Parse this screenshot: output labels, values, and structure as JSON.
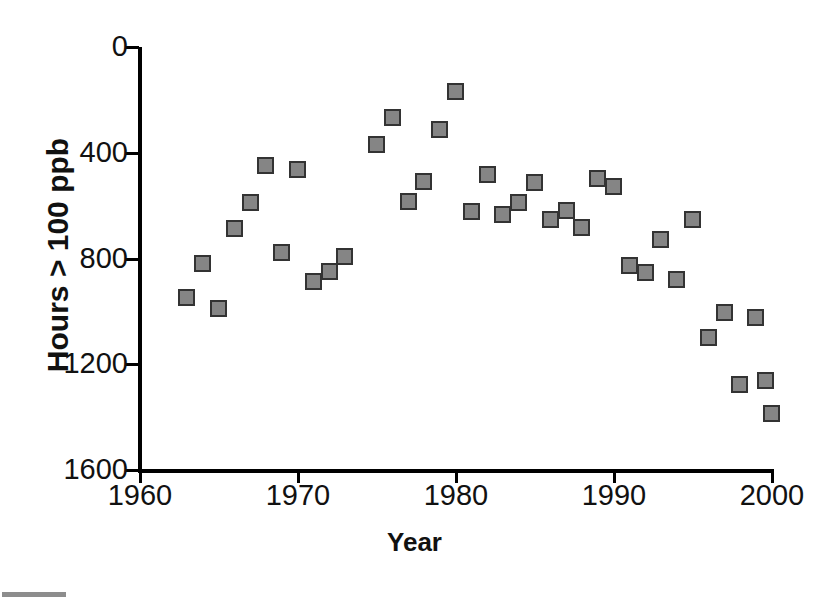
{
  "chart_data": {
    "type": "scatter",
    "title": "",
    "xlabel": "Year",
    "ylabel": "Hours > 100 ppb",
    "xlim": [
      1960,
      2000
    ],
    "ylim": [
      0,
      1600
    ],
    "xticks": [
      1960,
      1970,
      1980,
      1990,
      2000
    ],
    "yticks": [
      0,
      400,
      800,
      1200,
      1600
    ],
    "grid": false,
    "legend": null,
    "marker": {
      "shape": "square",
      "fill_color": "#858585",
      "edge_color": "#333333"
    },
    "x": [
      1963,
      1964,
      1965,
      1966,
      1967,
      1968,
      1969,
      1970,
      1971,
      1972,
      1973,
      1975,
      1976,
      1977,
      1978,
      1979,
      1980,
      1981,
      1982,
      1983,
      1984,
      1985,
      1986,
      1987,
      1988,
      1989,
      1990,
      1991,
      1992,
      1993,
      1994,
      1995,
      1996,
      1997,
      1998,
      1999
    ],
    "y": [
      650,
      780,
      610,
      910,
      1010,
      1150,
      820,
      1135,
      710,
      750,
      805,
      1230,
      1330,
      1015,
      1090,
      1285,
      1430,
      975,
      1115,
      965,
      1010,
      1085,
      945,
      980,
      915,
      1100,
      1070,
      770,
      745,
      870,
      720,
      945,
      500,
      595,
      320,
      575
    ],
    "points": [
      {
        "x": 1963,
        "y": 650
      },
      {
        "x": 1964,
        "y": 780
      },
      {
        "x": 1965,
        "y": 610
      },
      {
        "x": 1966,
        "y": 910
      },
      {
        "x": 1967,
        "y": 1010
      },
      {
        "x": 1968,
        "y": 1150
      },
      {
        "x": 1969,
        "y": 820
      },
      {
        "x": 1970,
        "y": 1135
      },
      {
        "x": 1971,
        "y": 710
      },
      {
        "x": 1972,
        "y": 750
      },
      {
        "x": 1973,
        "y": 805
      },
      {
        "x": 1975,
        "y": 1230
      },
      {
        "x": 1976,
        "y": 1330
      },
      {
        "x": 1977,
        "y": 1015
      },
      {
        "x": 1978,
        "y": 1090
      },
      {
        "x": 1979,
        "y": 1285
      },
      {
        "x": 1980,
        "y": 1430
      },
      {
        "x": 1981,
        "y": 975
      },
      {
        "x": 1982,
        "y": 1115
      },
      {
        "x": 1983,
        "y": 965
      },
      {
        "x": 1984,
        "y": 1010
      },
      {
        "x": 1985,
        "y": 1085
      },
      {
        "x": 1986,
        "y": 945
      },
      {
        "x": 1987,
        "y": 980
      },
      {
        "x": 1988,
        "y": 915
      },
      {
        "x": 1989,
        "y": 1100
      },
      {
        "x": 1990,
        "y": 1070
      },
      {
        "x": 1991,
        "y": 770
      },
      {
        "x": 1992,
        "y": 745
      },
      {
        "x": 1993,
        "y": 870
      },
      {
        "x": 1994,
        "y": 720
      },
      {
        "x": 1995,
        "y": 945
      },
      {
        "x": 1996,
        "y": 500
      },
      {
        "x": 1997,
        "y": 595
      },
      {
        "x": 1998,
        "y": 320
      },
      {
        "x": 1999,
        "y": 575
      },
      {
        "x": 1999.6,
        "y": 335
      },
      {
        "x": 2000,
        "y": 210
      }
    ]
  },
  "axis": {
    "y_tick_labels": [
      "1600",
      "1200",
      "800",
      "400",
      "0"
    ],
    "x_tick_labels": [
      "1960",
      "1970",
      "1980",
      "1990",
      "2000"
    ],
    "y_title": "Hours > 100 ppb",
    "x_title": "Year"
  },
  "geometry": {
    "x_left_px": 140,
    "x_right_px": 772,
    "y_top_px": 47,
    "y_bottom_px": 470,
    "x_min": 1960,
    "x_max": 2000,
    "y_min": 0,
    "y_max": 1600
  }
}
